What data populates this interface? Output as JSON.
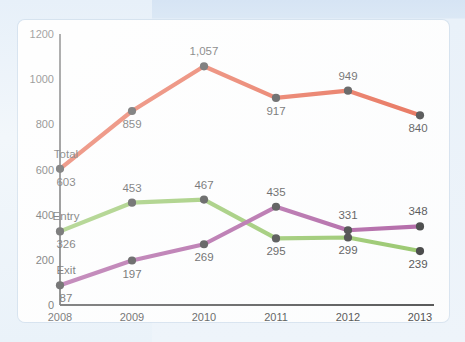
{
  "chart_data": {
    "type": "line",
    "title": "",
    "subtitle": "",
    "xlabel": "",
    "ylabel": "",
    "categories": [
      "2008",
      "2009",
      "2010",
      "2011",
      "2012",
      "2013"
    ],
    "x": [
      2008,
      2009,
      2010,
      2011,
      2012,
      2013
    ],
    "ylim": [
      0,
      1200
    ],
    "yticks": [
      0,
      200,
      400,
      600,
      800,
      1000,
      1200
    ],
    "ytick_labels": [
      "0",
      "200",
      "400",
      "600",
      "800",
      "1000",
      "1200"
    ],
    "grid": false,
    "legend_position": "inline-left",
    "markers": "filled-circle-black",
    "series": [
      {
        "name": "Total",
        "color": "#E03C1B",
        "values": [
          603,
          859,
          1057,
          917,
          949,
          840
        ],
        "data_labels": [
          "603",
          "859",
          "1,057",
          "917",
          "949",
          "840"
        ]
      },
      {
        "name": "Entry",
        "color": "#7DB844",
        "values": [
          326,
          453,
          467,
          295,
          299,
          239
        ],
        "data_labels": [
          "326",
          "453",
          "467",
          "295",
          "299",
          "239"
        ]
      },
      {
        "name": "Exit",
        "color": "#9B3A8C",
        "values": [
          87,
          197,
          269,
          435,
          331,
          348
        ],
        "data_labels": [
          "87",
          "197",
          "269",
          "435",
          "331",
          "348"
        ]
      }
    ]
  },
  "axis": {
    "y_ticks": [
      {
        "label": "1200",
        "value": 1200
      },
      {
        "label": "1000",
        "value": 1000
      },
      {
        "label": "800",
        "value": 800
      },
      {
        "label": "600",
        "value": 600
      },
      {
        "label": "400",
        "value": 400
      },
      {
        "label": "200",
        "value": 200
      },
      {
        "label": "0",
        "value": 0
      }
    ],
    "x_ticks": [
      {
        "label": "2008"
      },
      {
        "label": "2009"
      },
      {
        "label": "2010"
      },
      {
        "label": "2011"
      },
      {
        "label": "2012"
      },
      {
        "label": "2013"
      }
    ]
  },
  "series_labels": [
    {
      "name": "Total"
    },
    {
      "name": "Entry"
    },
    {
      "name": "Exit"
    }
  ],
  "colors": {
    "total": "#E03C1B",
    "entry": "#7DB844",
    "exit": "#9B3A8C",
    "axis": "#4a4a4a",
    "text": "#1c1c1c",
    "card": "#fdfdfd",
    "background": "#dfeaf6"
  }
}
